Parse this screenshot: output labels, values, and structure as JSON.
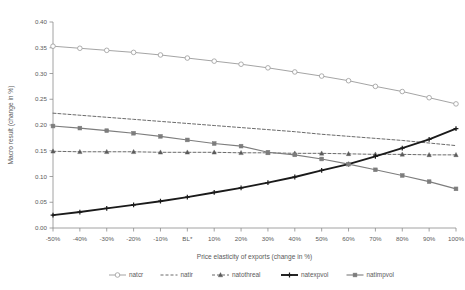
{
  "figure": {
    "clipped_caption_top": "",
    "background_color": "#ffffff"
  },
  "axes": {
    "y_title": "Macro result (change in %)",
    "x_title": "Price elasticity of exports (change in %)",
    "y_ticks": [
      "0.00",
      "0.05",
      "0.10",
      "0.15",
      "0.20",
      "0.25",
      "0.30",
      "0.35",
      "0.40"
    ],
    "x_ticks": [
      "-50%",
      "-40%",
      "-30%",
      "-20%",
      "-10%",
      "BL*",
      "10%",
      "20%",
      "30%",
      "40%",
      "50%",
      "60%",
      "70%",
      "80%",
      "90%",
      "100%"
    ],
    "axis_color": "#8c8c8c",
    "tick_color": "#8c8c8c"
  },
  "legend": {
    "position": "bottom",
    "items": [
      {
        "label": "natcr",
        "color": "#9a9a9a",
        "marker": "circle-open",
        "dash": "solid",
        "width": 0.9
      },
      {
        "label": "natir",
        "color": "#5a5a5a",
        "marker": "none",
        "dash": "dashed",
        "width": 0.9
      },
      {
        "label": "natothreal",
        "color": "#5a5a5a",
        "marker": "triangle",
        "dash": "dashed",
        "width": 0.9
      },
      {
        "label": "natexpvol",
        "color": "#1a1a1a",
        "marker": "plus",
        "dash": "solid",
        "width": 1.9
      },
      {
        "label": "natimpvol",
        "color": "#7d7d7d",
        "marker": "square",
        "dash": "solid",
        "width": 1.1
      }
    ]
  },
  "chart_data": {
    "type": "line",
    "title": "",
    "xlabel": "Price elasticity of exports (change in %)",
    "ylabel": "Macro result (change in %)",
    "categories": [
      "-50%",
      "-40%",
      "-30%",
      "-20%",
      "-10%",
      "BL*",
      "10%",
      "20%",
      "30%",
      "40%",
      "50%",
      "60%",
      "70%",
      "80%",
      "90%",
      "100%"
    ],
    "ylim": [
      0.0,
      0.4
    ],
    "ytick_step": 0.05,
    "grid": false,
    "legend_position": "bottom",
    "series": [
      {
        "name": "natcr",
        "color": "#9a9a9a",
        "marker": "circle-open",
        "dash": "solid",
        "values": [
          0.353,
          0.349,
          0.345,
          0.341,
          0.336,
          0.33,
          0.324,
          0.318,
          0.311,
          0.303,
          0.295,
          0.286,
          0.275,
          0.265,
          0.253,
          0.241
        ]
      },
      {
        "name": "natir",
        "color": "#5a5a5a",
        "marker": "none",
        "dash": "dashed",
        "values": [
          0.223,
          0.219,
          0.215,
          0.211,
          0.207,
          0.203,
          0.199,
          0.195,
          0.191,
          0.187,
          0.182,
          0.178,
          0.174,
          0.17,
          0.165,
          0.16
        ]
      },
      {
        "name": "natothreal",
        "color": "#5a5a5a",
        "marker": "triangle",
        "dash": "dashed",
        "values": [
          0.149,
          0.148,
          0.148,
          0.148,
          0.147,
          0.147,
          0.147,
          0.146,
          0.146,
          0.145,
          0.145,
          0.144,
          0.143,
          0.143,
          0.142,
          0.142
        ]
      },
      {
        "name": "natexpvol",
        "color": "#1a1a1a",
        "marker": "plus",
        "dash": "solid",
        "values": [
          0.025,
          0.031,
          0.038,
          0.045,
          0.052,
          0.06,
          0.069,
          0.078,
          0.088,
          0.099,
          0.112,
          0.124,
          0.139,
          0.155,
          0.172,
          0.193
        ]
      },
      {
        "name": "natimpvol",
        "color": "#7d7d7d",
        "marker": "square",
        "dash": "solid",
        "values": [
          0.198,
          0.194,
          0.189,
          0.184,
          0.178,
          0.171,
          0.164,
          0.159,
          0.147,
          0.142,
          0.134,
          0.124,
          0.113,
          0.102,
          0.09,
          0.076
        ]
      }
    ]
  }
}
